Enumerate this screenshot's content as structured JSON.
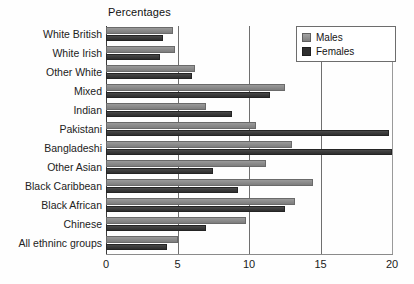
{
  "chart_data": {
    "type": "bar",
    "orientation": "horizontal",
    "title": "Percentages",
    "xlabel": "",
    "ylabel": "",
    "xlim": [
      0,
      20
    ],
    "xticks": [
      "0",
      "5",
      "10",
      "15",
      "20"
    ],
    "grid": true,
    "legend_position": "top-right",
    "categories": [
      "White British",
      "White Irish",
      "Other White",
      "Mixed",
      "Indian",
      "Pakistani",
      "Bangladeshi",
      "Other Asian",
      "Black Caribbean",
      "Black African",
      "Chinese",
      "All ethninc groups"
    ],
    "series": [
      {
        "name": "Males",
        "color": "#8e8e8e",
        "values": [
          4.7,
          4.8,
          6.2,
          12.5,
          7.0,
          10.5,
          13.0,
          11.2,
          14.5,
          13.2,
          9.8,
          5.0
        ]
      },
      {
        "name": "Females",
        "color": "#333333",
        "values": [
          4.0,
          3.8,
          6.0,
          11.5,
          8.8,
          19.8,
          20.0,
          7.5,
          9.2,
          12.5,
          7.0,
          4.3
        ]
      }
    ]
  }
}
